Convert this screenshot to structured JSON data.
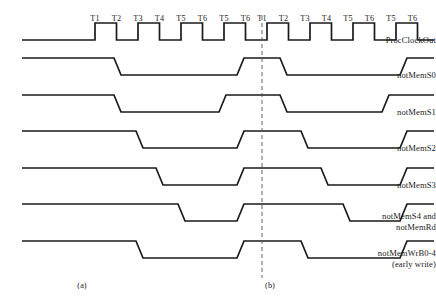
{
  "figure": {
    "type": "timing-diagram",
    "width": 436,
    "height": 304,
    "background_color": "#ffffff",
    "trace_color": "#1a1a1a",
    "divider_color": "#555555"
  },
  "signals": [
    {
      "name": "ProcClockOut",
      "label": "ProcClockOut",
      "kind": "clock",
      "baseline_y": 40
    },
    {
      "name": "notMemS0",
      "label": "notMemS0",
      "kind": "strobe",
      "baseline_y": 75
    },
    {
      "name": "notMemS1",
      "label": "notMemS1",
      "kind": "strobe",
      "baseline_y": 112
    },
    {
      "name": "notMemS2",
      "label": "notMemS2",
      "kind": "strobe",
      "baseline_y": 148
    },
    {
      "name": "notMemS3",
      "label": "notMemS3",
      "kind": "strobe",
      "baseline_y": 185
    },
    {
      "name": "notMemS4_notMemRd",
      "label": "notMemS4 and\nnotMemRd",
      "kind": "strobe",
      "baseline_y": 221
    },
    {
      "name": "notMemWrB0_4",
      "label": "notMemWrB0-4\n(early write)",
      "kind": "strobe",
      "baseline_y": 258
    }
  ],
  "tick_labels": {
    "panel_a": [
      "T1",
      "T2",
      "T3",
      "T4",
      "T5",
      "T6",
      "T5",
      "T6"
    ],
    "panel_b": [
      "T1",
      "T2",
      "T3",
      "T4",
      "T5",
      "T6",
      "T5",
      "T6"
    ],
    "y": 14
  },
  "panels": [
    {
      "id": "a",
      "label": "(a)",
      "x": 82,
      "y": 281
    },
    {
      "id": "b",
      "label": "(b)",
      "x": 270,
      "y": 281
    }
  ],
  "divider": {
    "x": 262,
    "y_top": 16,
    "y_bottom": 278,
    "style": "dashed"
  },
  "chart_data": {
    "type": "line",
    "title": "",
    "xlabel": "",
    "ylabel": "",
    "x_start": 22,
    "x_end": 434,
    "clock": {
      "first_rise_x": 95,
      "period": 43,
      "duty": 0.5,
      "pulse_count": 9,
      "high_offset": -17,
      "stroke": 1.7
    },
    "strobes": [
      {
        "signal": "notMemS0",
        "fall_a": 114,
        "rise_a": 237,
        "fall_b": 280,
        "rise_b": 400,
        "amp": 17
      },
      {
        "signal": "notMemS1",
        "fall_a": 114,
        "rise_a": 219,
        "fall_b": 280,
        "rise_b": 382,
        "amp": 17
      },
      {
        "signal": "notMemS2",
        "fall_a": 136,
        "rise_a": 237,
        "fall_b": 301,
        "rise_b": 400,
        "amp": 17
      },
      {
        "signal": "notMemS3",
        "fall_a": 156,
        "rise_a": 237,
        "fall_b": 321,
        "rise_b": 400,
        "amp": 17
      },
      {
        "signal": "notMemS4_notMemRd",
        "fall_a": 178,
        "rise_a": 237,
        "fall_b": 343,
        "rise_b": 400,
        "amp": 17
      },
      {
        "signal": "notMemWrB0_4",
        "fall_a": 136,
        "rise_a": 237,
        "fall_b": 301,
        "rise_b": 400,
        "amp": 17
      }
    ],
    "slew": 7,
    "grid": false,
    "legend": "none"
  }
}
